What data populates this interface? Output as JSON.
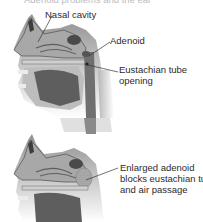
{
  "figure": {
    "title_fragment": "Adenoid problems and the ear",
    "panels": [
      {
        "id": "normal",
        "labels": {
          "nasal_cavity": "Nasal cavity",
          "adenoid": "Adenoid",
          "eustachian_line1": "Eustachian tube",
          "eustachian_line2": "opening"
        }
      },
      {
        "id": "enlarged",
        "labels": {
          "line1": "Enlarged adenoid",
          "line2": "blocks eustachian tube",
          "line3": "and air passage"
        }
      }
    ],
    "colors": {
      "background": "#ffffff",
      "tissue_light": "#d9d9d9",
      "tissue_mid": "#9a9a9a",
      "tissue_dark": "#4a4a4a",
      "leader_line": "#333333",
      "text": "#2b2b2b"
    }
  }
}
